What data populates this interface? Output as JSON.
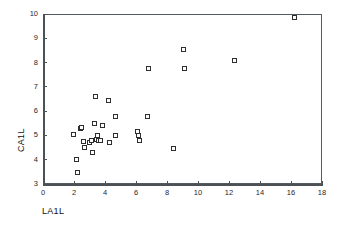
{
  "chart_data": {
    "type": "scatter",
    "title": "",
    "xlabel": "LA1L",
    "ylabel": "CA1L",
    "xlim": [
      0,
      18
    ],
    "ylim": [
      3,
      10
    ],
    "xticks": [
      0,
      2,
      4,
      6,
      8,
      10,
      12,
      14,
      16,
      18
    ],
    "yticks": [
      3,
      4,
      5,
      6,
      7,
      8,
      9,
      10
    ],
    "xtick_labels": [
      "0",
      "2",
      "4",
      "6",
      "8",
      "10",
      "12",
      "14",
      "16",
      "18"
    ],
    "ytick_labels": [
      "3",
      "4",
      "5",
      "6",
      "7",
      "8",
      "9",
      "10"
    ],
    "grid": false,
    "legend": false,
    "marker": "open-square",
    "points": [
      {
        "x": 1.95,
        "y": 5.02
      },
      {
        "x": 2.15,
        "y": 4.0
      },
      {
        "x": 2.2,
        "y": 3.47
      },
      {
        "x": 2.45,
        "y": 5.28
      },
      {
        "x": 2.5,
        "y": 5.33
      },
      {
        "x": 2.6,
        "y": 4.75
      },
      {
        "x": 2.7,
        "y": 4.5
      },
      {
        "x": 3.0,
        "y": 4.72
      },
      {
        "x": 3.1,
        "y": 4.78
      },
      {
        "x": 3.2,
        "y": 4.3
      },
      {
        "x": 3.35,
        "y": 5.48
      },
      {
        "x": 3.4,
        "y": 6.6
      },
      {
        "x": 3.45,
        "y": 4.82
      },
      {
        "x": 3.5,
        "y": 5.0
      },
      {
        "x": 3.55,
        "y": 4.8
      },
      {
        "x": 3.7,
        "y": 4.8
      },
      {
        "x": 3.85,
        "y": 5.4
      },
      {
        "x": 4.2,
        "y": 6.45
      },
      {
        "x": 4.3,
        "y": 4.72
      },
      {
        "x": 4.65,
        "y": 5.77
      },
      {
        "x": 4.7,
        "y": 5.0
      },
      {
        "x": 6.1,
        "y": 5.18
      },
      {
        "x": 6.15,
        "y": 5.0
      },
      {
        "x": 6.25,
        "y": 4.8
      },
      {
        "x": 6.75,
        "y": 5.77
      },
      {
        "x": 6.8,
        "y": 7.77
      },
      {
        "x": 8.4,
        "y": 4.47
      },
      {
        "x": 9.05,
        "y": 8.53
      },
      {
        "x": 9.15,
        "y": 7.75
      },
      {
        "x": 12.35,
        "y": 8.08
      },
      {
        "x": 16.2,
        "y": 9.85
      }
    ]
  },
  "colors": {
    "axis": "#4c5155",
    "frame": "#555a5e",
    "marker_edge": "#2e2e2e",
    "marker_fill": "#ffffff",
    "text": "#111111",
    "background": "#ffffff"
  }
}
